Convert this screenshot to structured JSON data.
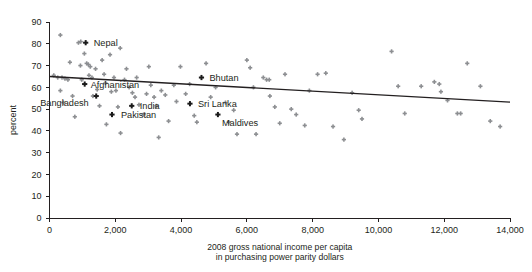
{
  "chart_data": {
    "type": "scatter",
    "title": "",
    "xlabel": "2008 gross national income per capita in purchasing power parity dollars",
    "xlabel_line1": "2008 gross national income per capita",
    "xlabel_line2": "in purchasing power parity dollars",
    "ylabel": "percent",
    "xlim": [
      0,
      14000
    ],
    "ylim": [
      0,
      90
    ],
    "xticks": [
      0,
      2000,
      4000,
      6000,
      8000,
      10000,
      12000,
      14000
    ],
    "xtick_labels": [
      "0",
      "2,000",
      "4,000",
      "6,000",
      "8,000",
      "10,000",
      "12,000",
      "14,000"
    ],
    "yticks": [
      0,
      10,
      20,
      30,
      40,
      50,
      60,
      70,
      80,
      90
    ],
    "ytick_labels": [
      "0",
      "10",
      "20",
      "30",
      "40",
      "50",
      "60",
      "70",
      "80",
      "90"
    ],
    "grid": false,
    "legend": null,
    "marker_color": "#8d8f92",
    "highlight_color": "#1a1a1a",
    "trendline": {
      "color": "#231f20",
      "x": [
        0,
        14000
      ],
      "y": [
        65.0,
        53.2
      ]
    },
    "highlighted_points": [
      {
        "label": "Nepal",
        "x": 1100,
        "y": 80.5,
        "label_dx": 8,
        "label_dy": 3
      },
      {
        "label": "Afghanistan",
        "x": 1070,
        "y": 61.5,
        "label_dx": 6,
        "label_dy": 3.5
      },
      {
        "label": "Bangladesh",
        "x": 1420,
        "y": 56.0,
        "label_dx": -56,
        "label_dy": 10
      },
      {
        "label": "Pakistan",
        "x": 1900,
        "y": 47.5,
        "label_dx": 9,
        "label_dy": 3.5
      },
      {
        "label": "India",
        "x": 2500,
        "y": 51.5,
        "label_dx": 8,
        "label_dy": 3.5
      },
      {
        "label": "Bhutan",
        "x": 4620,
        "y": 64.5,
        "label_dx": 8,
        "label_dy": 3.5
      },
      {
        "label": "Sri Lanka",
        "x": 4270,
        "y": 52.5,
        "label_dx": 8,
        "label_dy": 3.5
      },
      {
        "label": "Maldives",
        "x": 5120,
        "y": 47.5,
        "label_dx": 4,
        "label_dy": 11
      }
    ],
    "points": [
      {
        "x": 330,
        "y": 84.0
      },
      {
        "x": 130,
        "y": 65.5
      },
      {
        "x": 250,
        "y": 64.5
      },
      {
        "x": 380,
        "y": 64.5
      },
      {
        "x": 470,
        "y": 64.0
      },
      {
        "x": 560,
        "y": 63.5
      },
      {
        "x": 330,
        "y": 58.5
      },
      {
        "x": 420,
        "y": 53.0
      },
      {
        "x": 620,
        "y": 71.5
      },
      {
        "x": 700,
        "y": 56.0
      },
      {
        "x": 770,
        "y": 46.5
      },
      {
        "x": 880,
        "y": 80.5
      },
      {
        "x": 950,
        "y": 81.0
      },
      {
        "x": 940,
        "y": 70.0
      },
      {
        "x": 980,
        "y": 63.5
      },
      {
        "x": 1060,
        "y": 75.5
      },
      {
        "x": 1130,
        "y": 71.0
      },
      {
        "x": 1180,
        "y": 70.5
      },
      {
        "x": 1240,
        "y": 69.5
      },
      {
        "x": 1200,
        "y": 65.5
      },
      {
        "x": 1290,
        "y": 64.5
      },
      {
        "x": 1320,
        "y": 56.0
      },
      {
        "x": 1400,
        "y": 68.5
      },
      {
        "x": 1450,
        "y": 59.0
      },
      {
        "x": 1520,
        "y": 51.5
      },
      {
        "x": 1600,
        "y": 72.5
      },
      {
        "x": 1660,
        "y": 66.0
      },
      {
        "x": 1700,
        "y": 62.0
      },
      {
        "x": 1730,
        "y": 43.0
      },
      {
        "x": 1840,
        "y": 75.0
      },
      {
        "x": 1880,
        "y": 58.0
      },
      {
        "x": 1960,
        "y": 64.5
      },
      {
        "x": 2020,
        "y": 58.5
      },
      {
        "x": 2080,
        "y": 51.0
      },
      {
        "x": 2150,
        "y": 78.0
      },
      {
        "x": 2160,
        "y": 39.0
      },
      {
        "x": 2280,
        "y": 63.5
      },
      {
        "x": 2340,
        "y": 68.5
      },
      {
        "x": 2420,
        "y": 60.0
      },
      {
        "x": 2520,
        "y": 57.5
      },
      {
        "x": 2600,
        "y": 55.5
      },
      {
        "x": 2650,
        "y": 64.5
      },
      {
        "x": 2720,
        "y": 52.0
      },
      {
        "x": 2860,
        "y": 47.5
      },
      {
        "x": 2950,
        "y": 57.0
      },
      {
        "x": 3020,
        "y": 69.5
      },
      {
        "x": 3080,
        "y": 61.0
      },
      {
        "x": 3180,
        "y": 55.5
      },
      {
        "x": 3250,
        "y": 51.5
      },
      {
        "x": 3320,
        "y": 37.0
      },
      {
        "x": 3400,
        "y": 58.5
      },
      {
        "x": 3520,
        "y": 56.5
      },
      {
        "x": 3620,
        "y": 44.5
      },
      {
        "x": 3780,
        "y": 61.0
      },
      {
        "x": 3860,
        "y": 53.5
      },
      {
        "x": 3980,
        "y": 69.5
      },
      {
        "x": 4140,
        "y": 57.0
      },
      {
        "x": 4260,
        "y": 61.5
      },
      {
        "x": 4400,
        "y": 47.0
      },
      {
        "x": 4480,
        "y": 44.0
      },
      {
        "x": 4760,
        "y": 71.0
      },
      {
        "x": 4900,
        "y": 55.5
      },
      {
        "x": 5050,
        "y": 60.0
      },
      {
        "x": 5350,
        "y": 53.0
      },
      {
        "x": 5450,
        "y": 44.0
      },
      {
        "x": 5600,
        "y": 49.5
      },
      {
        "x": 5700,
        "y": 38.5
      },
      {
        "x": 6000,
        "y": 72.5
      },
      {
        "x": 6100,
        "y": 69.0
      },
      {
        "x": 6200,
        "y": 60.0
      },
      {
        "x": 6280,
        "y": 38.5
      },
      {
        "x": 6500,
        "y": 64.5
      },
      {
        "x": 6600,
        "y": 63.5
      },
      {
        "x": 6680,
        "y": 63.5
      },
      {
        "x": 6700,
        "y": 56.0
      },
      {
        "x": 6850,
        "y": 51.0
      },
      {
        "x": 7000,
        "y": 43.5
      },
      {
        "x": 7160,
        "y": 66.0
      },
      {
        "x": 7350,
        "y": 50.0
      },
      {
        "x": 7500,
        "y": 47.5
      },
      {
        "x": 7760,
        "y": 42.5
      },
      {
        "x": 7900,
        "y": 58.5
      },
      {
        "x": 8150,
        "y": 66.0
      },
      {
        "x": 8400,
        "y": 66.5
      },
      {
        "x": 8620,
        "y": 42.0
      },
      {
        "x": 8950,
        "y": 36.0
      },
      {
        "x": 9200,
        "y": 57.5
      },
      {
        "x": 9400,
        "y": 49.5
      },
      {
        "x": 9500,
        "y": 45.5
      },
      {
        "x": 10400,
        "y": 76.5
      },
      {
        "x": 10600,
        "y": 60.5
      },
      {
        "x": 10800,
        "y": 48.0
      },
      {
        "x": 11300,
        "y": 60.5
      },
      {
        "x": 11700,
        "y": 62.5
      },
      {
        "x": 11850,
        "y": 61.5
      },
      {
        "x": 11900,
        "y": 58.0
      },
      {
        "x": 12100,
        "y": 54.0
      },
      {
        "x": 12400,
        "y": 48.0
      },
      {
        "x": 12500,
        "y": 48.0
      },
      {
        "x": 12700,
        "y": 71.0
      },
      {
        "x": 13100,
        "y": 60.5
      },
      {
        "x": 13400,
        "y": 44.5
      },
      {
        "x": 13700,
        "y": 42.0
      }
    ]
  }
}
